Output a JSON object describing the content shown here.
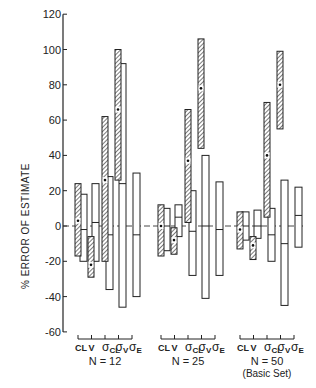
{
  "chart_data": {
    "type": "bar",
    "subtype": "floating-range-bars",
    "title": "",
    "xlabel": "",
    "ylabel": "% ERROR OF ESTIMATE",
    "ylim": [
      -60,
      120
    ],
    "yticks": [
      -60,
      -40,
      -20,
      0,
      20,
      40,
      60,
      80,
      100,
      120
    ],
    "grid": false,
    "reference_line": {
      "y": 0,
      "style": "dashed"
    },
    "categories": [
      "CL",
      "V",
      "σCL",
      "σV",
      "σE"
    ],
    "category_labels": [
      {
        "main": "CL",
        "sub": ""
      },
      {
        "main": "V",
        "sub": ""
      },
      {
        "main": "σ",
        "sub": "CL"
      },
      {
        "main": "σ",
        "sub": "V"
      },
      {
        "main": "σ",
        "sub": "E"
      }
    ],
    "legend": [
      {
        "name": "hatched",
        "description": "hatched range bar with dot marking mean"
      },
      {
        "name": "open",
        "description": "open range bar with median line"
      }
    ],
    "groups": [
      {
        "label": "N = 12",
        "sublabel": "",
        "hatched": [
          {
            "category": "CL",
            "low": -17,
            "high": 24,
            "dot": 3
          },
          {
            "category": "V",
            "low": -29,
            "high": -6,
            "dot": -22
          },
          {
            "category": "σCL",
            "low": -20,
            "high": 62,
            "dot": 26
          },
          {
            "category": "σV",
            "low": 26,
            "high": 100,
            "dot": 66
          },
          {
            "category": "σE",
            "low": null,
            "high": null,
            "dot": null
          }
        ],
        "open": [
          {
            "category": "CL",
            "low": -20,
            "high": 18,
            "median": -2
          },
          {
            "category": "V",
            "low": -20,
            "high": 24,
            "median": 2
          },
          {
            "category": "σCL",
            "low": -36,
            "high": 28,
            "median": -5
          },
          {
            "category": "σV",
            "low": -46,
            "high": 92,
            "median": 24
          },
          {
            "category": "σE",
            "low": -40,
            "high": 30,
            "median": -5
          }
        ]
      },
      {
        "label": "N = 25",
        "sublabel": "",
        "hatched": [
          {
            "category": "CL",
            "low": -17,
            "high": 12,
            "dot": 0
          },
          {
            "category": "V",
            "low": -16,
            "high": -1,
            "dot": -8
          },
          {
            "category": "σCL",
            "low": 2,
            "high": 66,
            "dot": 37
          },
          {
            "category": "σV",
            "low": 44,
            "high": 106,
            "dot": 78
          },
          {
            "category": "σE",
            "low": null,
            "high": null,
            "dot": null
          }
        ],
        "open": [
          {
            "category": "CL",
            "low": -14,
            "high": 10,
            "median": 0
          },
          {
            "category": "V",
            "low": -6,
            "high": 12,
            "median": 5
          },
          {
            "category": "σCL",
            "low": -28,
            "high": 20,
            "median": -3
          },
          {
            "category": "σV",
            "low": -41,
            "high": 40,
            "median": 0
          },
          {
            "category": "σE",
            "low": -28,
            "high": 25,
            "median": -2
          }
        ]
      },
      {
        "label": "N = 50",
        "sublabel": "(Basic Set)",
        "hatched": [
          {
            "category": "CL",
            "low": -13,
            "high": 8,
            "dot": -2
          },
          {
            "category": "V",
            "low": -19,
            "high": -6,
            "dot": -11
          },
          {
            "category": "σCL",
            "low": 5,
            "high": 70,
            "dot": 40
          },
          {
            "category": "σV",
            "low": 55,
            "high": 99,
            "dot": 80
          },
          {
            "category": "σE",
            "low": null,
            "high": null,
            "dot": null
          }
        ],
        "open": [
          {
            "category": "CL",
            "low": -8,
            "high": 8,
            "median": 0
          },
          {
            "category": "V",
            "low": -7,
            "high": 9,
            "median": 0
          },
          {
            "category": "σCL",
            "low": -20,
            "high": 10,
            "median": -5
          },
          {
            "category": "σV",
            "low": -45,
            "high": 26,
            "median": -10
          },
          {
            "category": "σE",
            "low": -12,
            "high": 22,
            "median": 6
          }
        ]
      }
    ]
  },
  "axis": {
    "ylabel": "% ERROR OF ESTIMATE",
    "ytick_labels": [
      "120",
      "100",
      "80",
      "60",
      "40",
      "20",
      "0",
      "-20",
      "-40",
      "-60"
    ]
  },
  "groups": [
    {
      "label": "N = 12",
      "sublabel": ""
    },
    {
      "label": "N = 25",
      "sublabel": ""
    },
    {
      "label": "N = 50",
      "sublabel": "(Basic Set)"
    }
  ],
  "colors": {
    "ink": "#1a1a1a",
    "hatch": "#555555",
    "background": "#ffffff"
  }
}
